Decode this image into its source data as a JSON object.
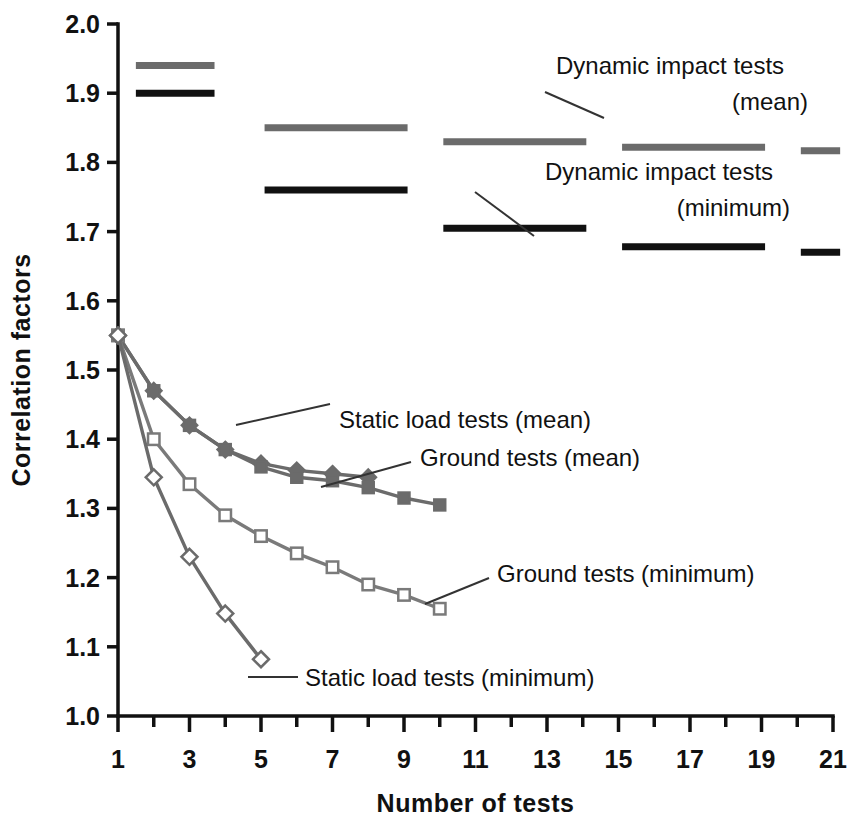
{
  "chart_data": {
    "type": "line",
    "title": "",
    "xlabel": "Number of tests",
    "ylabel": "Correlation factors",
    "xlim": [
      1,
      21
    ],
    "ylim": [
      1.0,
      2.0
    ],
    "xticks": [
      1,
      2,
      3,
      4,
      5,
      6,
      7,
      8,
      9,
      10,
      11,
      12,
      13,
      14,
      15,
      16,
      17,
      18,
      19,
      20,
      21
    ],
    "xtick_labels": [
      "1",
      "",
      "3",
      "",
      "5",
      "",
      "7",
      "",
      "9",
      "",
      "11",
      "",
      "13",
      "",
      "15",
      "",
      "17",
      "",
      "19",
      "",
      "21"
    ],
    "yticks": [
      1.0,
      1.1,
      1.2,
      1.3,
      1.4,
      1.5,
      1.6,
      1.7,
      1.8,
      1.9,
      2.0
    ],
    "ytick_labels": [
      "1.0",
      "1.1",
      "1.2",
      "1.3",
      "1.4",
      "1.5",
      "1.6",
      "1.7",
      "1.8",
      "1.9",
      "2.0"
    ],
    "grid": false,
    "legend_position": "inline-annotations",
    "colors": {
      "mean_gray": "#6b6b6b",
      "minimum_black": "#111111",
      "axis": "#111111"
    },
    "series": [
      {
        "name": "Static load tests (mean)",
        "marker": "filled-diamond",
        "color": "#6b6b6b",
        "x": [
          1,
          2,
          3,
          4,
          5,
          6,
          7,
          8
        ],
        "values": [
          1.55,
          1.47,
          1.42,
          1.385,
          1.365,
          1.355,
          1.35,
          1.345
        ]
      },
      {
        "name": "Ground tests (mean)",
        "marker": "filled-square",
        "color": "#6b6b6b",
        "x": [
          1,
          2,
          3,
          4,
          5,
          6,
          7,
          8,
          9,
          10
        ],
        "values": [
          1.55,
          1.47,
          1.42,
          1.385,
          1.36,
          1.345,
          1.34,
          1.33,
          1.315,
          1.305
        ]
      },
      {
        "name": "Ground tests (minimum)",
        "marker": "open-square",
        "color": "#7a7a7a",
        "x": [
          1,
          2,
          3,
          4,
          5,
          6,
          7,
          8,
          9,
          10
        ],
        "values": [
          1.55,
          1.4,
          1.335,
          1.29,
          1.26,
          1.235,
          1.215,
          1.19,
          1.175,
          1.155
        ]
      },
      {
        "name": "Static load tests (minimum)",
        "marker": "open-diamond",
        "color": "#6b6b6b",
        "x": [
          1,
          2,
          3,
          4,
          5
        ],
        "values": [
          1.55,
          1.345,
          1.23,
          1.148,
          1.082
        ]
      }
    ],
    "segments": [
      {
        "name": "Dynamic impact tests (mean)",
        "color": "#6b6b6b",
        "x0": 1.5,
        "x1": 3.7,
        "y": 1.94
      },
      {
        "name": "Dynamic impact tests (minimum)",
        "color": "#111111",
        "x0": 1.5,
        "x1": 3.7,
        "y": 1.9
      },
      {
        "name": "Dynamic impact tests (mean)",
        "color": "#6b6b6b",
        "x0": 5.1,
        "x1": 9.1,
        "y": 1.85
      },
      {
        "name": "Dynamic impact tests (minimum)",
        "color": "#111111",
        "x0": 5.1,
        "x1": 9.1,
        "y": 1.76
      },
      {
        "name": "Dynamic impact tests (mean)",
        "color": "#6b6b6b",
        "x0": 10.1,
        "x1": 14.1,
        "y": 1.83
      },
      {
        "name": "Dynamic impact tests (minimum)",
        "color": "#111111",
        "x0": 10.1,
        "x1": 14.1,
        "y": 1.705
      },
      {
        "name": "Dynamic impact tests (mean)",
        "color": "#6b6b6b",
        "x0": 15.1,
        "x1": 19.1,
        "y": 1.822
      },
      {
        "name": "Dynamic impact tests (minimum)",
        "color": "#111111",
        "x0": 15.1,
        "x1": 19.1,
        "y": 1.678
      },
      {
        "name": "Dynamic impact tests (mean)",
        "color": "#6b6b6b",
        "x0": 20.1,
        "x1": 21.2,
        "y": 1.817
      },
      {
        "name": "Dynamic impact tests (minimum)",
        "color": "#111111",
        "x0": 20.1,
        "x1": 21.2,
        "y": 1.67
      }
    ],
    "annotations": [
      {
        "id": "dyn-mean",
        "line1": "Dynamic impact tests",
        "line2": "(mean)"
      },
      {
        "id": "dyn-min",
        "line1": "Dynamic impact tests",
        "line2": "(minimum)"
      },
      {
        "id": "static-mean",
        "line1": "Static load tests (mean)",
        "line2": ""
      },
      {
        "id": "ground-mean",
        "line1": "Ground tests (mean)",
        "line2": ""
      },
      {
        "id": "ground-min",
        "line1": "Ground tests (minimum)",
        "line2": ""
      },
      {
        "id": "static-min",
        "line1": "Static load tests (minimum)",
        "line2": ""
      }
    ]
  }
}
